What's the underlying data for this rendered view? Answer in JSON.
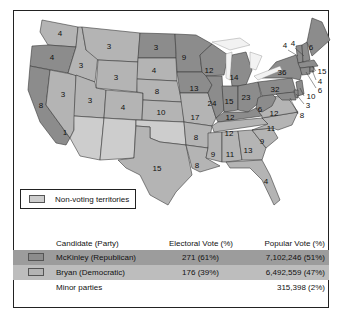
{
  "map": {
    "colors": {
      "republican": "#8c8c8c",
      "democratic": "#b4b4b4",
      "territory": "#cdcdcd"
    },
    "states": [
      {
        "name": "Washington",
        "votes": "4",
        "party": "dem"
      },
      {
        "name": "Oregon",
        "votes": "4",
        "party": "rep"
      },
      {
        "name": "California",
        "votes": "8",
        "party": "rep"
      },
      {
        "name": "California (split)",
        "votes": "1",
        "party": "dem"
      },
      {
        "name": "Idaho",
        "votes": "3",
        "party": "dem"
      },
      {
        "name": "Nevada",
        "votes": "3",
        "party": "dem"
      },
      {
        "name": "Montana",
        "votes": "3",
        "party": "dem"
      },
      {
        "name": "Wyoming",
        "votes": "3",
        "party": "dem"
      },
      {
        "name": "Utah",
        "votes": "3",
        "party": "dem"
      },
      {
        "name": "Colorado",
        "votes": "4",
        "party": "dem"
      },
      {
        "name": "North Dakota",
        "votes": "3",
        "party": "rep"
      },
      {
        "name": "South Dakota",
        "votes": "4",
        "party": "dem"
      },
      {
        "name": "Nebraska",
        "votes": "8",
        "party": "dem"
      },
      {
        "name": "Kansas",
        "votes": "10",
        "party": "dem"
      },
      {
        "name": "Texas",
        "votes": "15",
        "party": "dem"
      },
      {
        "name": "Minnesota",
        "votes": "9",
        "party": "rep"
      },
      {
        "name": "Iowa",
        "votes": "13",
        "party": "rep"
      },
      {
        "name": "Missouri",
        "votes": "17",
        "party": "dem"
      },
      {
        "name": "Arkansas",
        "votes": "8",
        "party": "dem"
      },
      {
        "name": "Louisiana",
        "votes": "8",
        "party": "dem"
      },
      {
        "name": "Wisconsin",
        "votes": "12",
        "party": "rep"
      },
      {
        "name": "Illinois",
        "votes": "24",
        "party": "rep"
      },
      {
        "name": "Michigan",
        "votes": "14",
        "party": "rep"
      },
      {
        "name": "Indiana",
        "votes": "15",
        "party": "rep"
      },
      {
        "name": "Ohio",
        "votes": "23",
        "party": "rep"
      },
      {
        "name": "Kentucky",
        "votes": "12",
        "party": "rep"
      },
      {
        "name": "Tennessee",
        "votes": "12",
        "party": "dem"
      },
      {
        "name": "Mississippi",
        "votes": "9",
        "party": "dem"
      },
      {
        "name": "Alabama",
        "votes": "11",
        "party": "dem"
      },
      {
        "name": "Georgia",
        "votes": "13",
        "party": "dem"
      },
      {
        "name": "Florida",
        "votes": "4",
        "party": "dem"
      },
      {
        "name": "South Carolina",
        "votes": "9",
        "party": "dem"
      },
      {
        "name": "North Carolina",
        "votes": "11",
        "party": "dem"
      },
      {
        "name": "Virginia",
        "votes": "12",
        "party": "dem"
      },
      {
        "name": "West Virginia",
        "votes": "6",
        "party": "rep"
      },
      {
        "name": "Pennsylvania",
        "votes": "32",
        "party": "rep"
      },
      {
        "name": "New York",
        "votes": "36",
        "party": "rep"
      },
      {
        "name": "Vermont",
        "votes": "4",
        "party": "rep"
      },
      {
        "name": "New Hampshire",
        "votes": "4",
        "party": "rep"
      },
      {
        "name": "Maine",
        "votes": "6",
        "party": "rep"
      },
      {
        "name": "Massachusetts",
        "votes": "15",
        "party": "rep"
      },
      {
        "name": "Rhode Island",
        "votes": "4",
        "party": "rep"
      },
      {
        "name": "Connecticut",
        "votes": "6",
        "party": "rep"
      },
      {
        "name": "New Jersey",
        "votes": "10",
        "party": "rep"
      },
      {
        "name": "Delaware",
        "votes": "3",
        "party": "rep"
      },
      {
        "name": "Maryland",
        "votes": "8",
        "party": "rep"
      }
    ]
  },
  "legend": {
    "territories_label": "Non-voting territories"
  },
  "table": {
    "headers": {
      "candidate": "Candidate (Party)",
      "electoral": "Electoral Vote (%)",
      "popular": "Popular Vote (%)"
    },
    "rows": [
      {
        "candidate": "McKinley (Republican)",
        "electoral": "271 (61%)",
        "popular": "7,102,246 (51%)"
      },
      {
        "candidate": "Bryan (Democratic)",
        "electoral": "176 (39%)",
        "popular": "6,492,559 (47%)"
      },
      {
        "candidate": "Minor parties",
        "electoral": "",
        "popular": "315,398 (2%)"
      }
    ]
  }
}
